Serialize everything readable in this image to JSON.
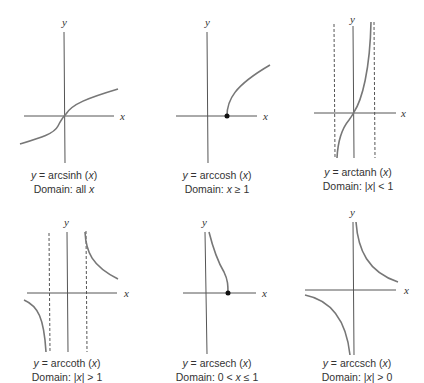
{
  "figure": {
    "axis_labels": {
      "x": "x",
      "y": "y"
    },
    "panels": [
      {
        "id": "arcsinh",
        "func_label": "y = arcsinh (x)",
        "equation_prefix": "y = ",
        "func_name": "arcsinh",
        "arg": "(x)",
        "domain_label": "Domain: all x",
        "domain_text": "Domain: all ",
        "domain_var": "x",
        "domain_rest": "",
        "asymptotes_x": [],
        "endpoint": null
      },
      {
        "id": "arccosh",
        "func_label": "y = arccosh (x)",
        "equation_prefix": "y = ",
        "func_name": "arccosh",
        "arg": "(x)",
        "domain_label": "Domain: x ≥ 1",
        "domain_text": "Domain: ",
        "domain_var": "x",
        "domain_rest": " ≥ 1",
        "asymptotes_x": [],
        "endpoint": [
          1,
          0
        ]
      },
      {
        "id": "arctanh",
        "func_label": "y = arctanh (x)",
        "equation_prefix": "y = ",
        "func_name": "arctanh",
        "arg": "(x)",
        "domain_label": "Domain: |x| < 1",
        "domain_text": "Domain: |",
        "domain_var": "x",
        "domain_rest": "| < 1",
        "asymptotes_x": [
          -1,
          1
        ],
        "endpoint": null
      },
      {
        "id": "arccoth",
        "func_label": "y = arccoth (x)",
        "equation_prefix": "y = ",
        "func_name": "arccoth",
        "arg": "(x)",
        "domain_label": "Domain: |x| > 1",
        "domain_text": "Domain: |",
        "domain_var": "x",
        "domain_rest": "| > 1",
        "asymptotes_x": [
          -1,
          1
        ],
        "endpoint": null
      },
      {
        "id": "arcsech",
        "func_label": "y = arcsech (x)",
        "equation_prefix": "y = ",
        "func_name": "arcsech",
        "arg": "(x)",
        "domain_label": "Domain: 0 < x ≤ 1",
        "domain_text": "Domain: 0 < ",
        "domain_var": "x",
        "domain_rest": " ≤ 1",
        "asymptotes_x": [],
        "endpoint": [
          1,
          0
        ]
      },
      {
        "id": "arccsch",
        "func_label": "y = arccsch (x)",
        "equation_prefix": "y = ",
        "func_name": "arccsch",
        "arg": "(x)",
        "domain_label": "Domain: |x| > 0",
        "domain_text": "Domain: |",
        "domain_var": "x",
        "domain_rest": "| > 0",
        "asymptotes_x": [],
        "endpoint": null
      }
    ]
  }
}
